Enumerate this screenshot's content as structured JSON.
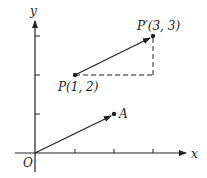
{
  "diagram": {
    "type": "vector-translation-coordinate-plot",
    "axes": {
      "x_label": "x",
      "y_label": "y",
      "origin_label": "O",
      "x_ticks": [
        1,
        2,
        3
      ],
      "y_ticks": [
        1,
        2,
        3
      ]
    },
    "points": [
      {
        "name": "P",
        "label": "P(1, 2)",
        "x": 1,
        "y": 2
      },
      {
        "name": "P'",
        "label": "P′(3, 3)",
        "x": 3,
        "y": 3
      },
      {
        "name": "A",
        "label": "A",
        "x": 2,
        "y": 1
      }
    ],
    "vectors": [
      {
        "from": "O",
        "to": "A",
        "style": "solid-arrow"
      },
      {
        "from": "P",
        "to": "P'",
        "style": "solid-arrow"
      }
    ],
    "guides": [
      {
        "from": [
          1,
          2
        ],
        "to": [
          3,
          2
        ],
        "style": "dashed"
      },
      {
        "from": [
          3,
          2
        ],
        "to": [
          3,
          3
        ],
        "style": "dashed"
      }
    ],
    "colors": {
      "ink": "#222222",
      "background": "#ffffff"
    }
  }
}
